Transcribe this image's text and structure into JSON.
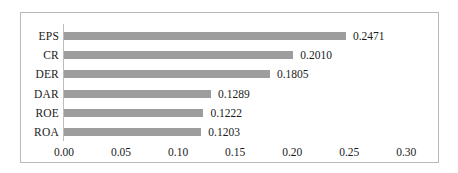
{
  "chart_data": {
    "type": "bar",
    "orientation": "horizontal",
    "title": "",
    "xlabel": "",
    "ylabel": "",
    "categories": [
      "EPS",
      "CR",
      "DER",
      "DAR",
      "ROE",
      "ROA"
    ],
    "values": [
      0.2471,
      0.201,
      0.1805,
      0.1289,
      0.1222,
      0.1203
    ],
    "data_labels": [
      "0.2471",
      "0.2010",
      "0.1805",
      "0.1289",
      "0.1222",
      "0.1203"
    ],
    "xlim": [
      0.0,
      0.3
    ],
    "xticks": [
      0.0,
      0.05,
      0.1,
      0.15,
      0.2,
      0.25,
      0.3
    ],
    "xtick_labels": [
      "0.00",
      "0.05",
      "0.10",
      "0.15",
      "0.20",
      "0.25",
      "0.30"
    ],
    "grid": false,
    "legend": null,
    "series_color": "#9d9d9d",
    "frame_border_color": "#b9b9b9",
    "axis_line_color": "#bdbdbd",
    "text_color": "#1a1a1a"
  }
}
